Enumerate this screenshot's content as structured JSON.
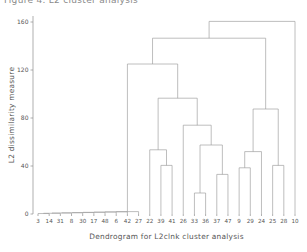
{
  "page": {
    "clipped_top_caption": "Figure 4. L2 cluster analysis"
  },
  "chart_data": {
    "type": "line",
    "chart_kind": "dendrogram",
    "title": "",
    "xlabel": "Dendrogram for L2clnk cluster analysis",
    "ylabel": "L2 dissimilarity measure",
    "ylim": [
      0,
      165
    ],
    "yticks": [
      0,
      40,
      80,
      120,
      160
    ],
    "ytick_labels": [
      "0",
      "40",
      "80",
      "120",
      "160"
    ],
    "grid": false,
    "legend": "none",
    "n_leaves": 24,
    "leaf_labels": [
      "3",
      "14",
      "31",
      "8",
      "30",
      "17",
      "48",
      "6",
      "42",
      "27",
      "22",
      "39",
      "41",
      "26",
      "33",
      "36",
      "37",
      "47",
      "9",
      "29",
      "24",
      "25",
      "28",
      "10"
    ],
    "leaf_heights": [
      0,
      0,
      0,
      0,
      0,
      0,
      0,
      0,
      0,
      0,
      0,
      0,
      0,
      0,
      0,
      0,
      0,
      0,
      0,
      0,
      0,
      0,
      0,
      0
    ],
    "merges": [
      {
        "id": "m1",
        "left": "3",
        "right": "14",
        "height": 0.4,
        "type": "leaf-leaf"
      },
      {
        "id": "m2",
        "left": "m1",
        "right": "31",
        "height": 0.6,
        "type": "node-leaf"
      },
      {
        "id": "m3",
        "left": "m2",
        "right": "8",
        "height": 0.8,
        "type": "node-leaf"
      },
      {
        "id": "m4",
        "left": "m3",
        "right": "30",
        "height": 1.0,
        "type": "node-leaf"
      },
      {
        "id": "m5",
        "left": "m4",
        "right": "17",
        "height": 1.2,
        "type": "node-leaf"
      },
      {
        "id": "m6",
        "left": "m5",
        "right": "48",
        "height": 1.4,
        "type": "node-leaf"
      },
      {
        "id": "m7",
        "left": "m6",
        "right": "6",
        "height": 1.6,
        "type": "node-leaf"
      },
      {
        "id": "m8",
        "left": "m7",
        "right": "42",
        "height": 1.8,
        "type": "node-leaf"
      },
      {
        "id": "m9",
        "left": "m8",
        "right": "27",
        "height": 2.0,
        "type": "node-leaf"
      },
      {
        "id": "m10",
        "left": "39",
        "right": "41",
        "height": 40.5,
        "type": "leaf-leaf"
      },
      {
        "id": "m11",
        "left": "22",
        "right": "m10",
        "height": 53.5,
        "type": "leaf-node"
      },
      {
        "id": "m12",
        "left": "33",
        "right": "36",
        "height": 17.5,
        "type": "leaf-leaf"
      },
      {
        "id": "m13",
        "left": "37",
        "right": "47",
        "height": 33.0,
        "type": "leaf-leaf"
      },
      {
        "id": "m14",
        "left": "m12",
        "right": "m13",
        "height": 57.5,
        "type": "node-node"
      },
      {
        "id": "m15",
        "left": "26",
        "right": "m14",
        "height": 74.0,
        "type": "leaf-node"
      },
      {
        "id": "m16",
        "left": "m11",
        "right": "m15",
        "height": 96.5,
        "type": "node-node"
      },
      {
        "id": "m17",
        "left": "9",
        "right": "29",
        "height": 38.5,
        "type": "leaf-leaf"
      },
      {
        "id": "m18",
        "left": "m17",
        "right": "24",
        "height": 52.0,
        "type": "node-leaf"
      },
      {
        "id": "m19",
        "left": "25",
        "right": "28",
        "height": 40.5,
        "type": "leaf-leaf"
      },
      {
        "id": "m20",
        "left": "m18",
        "right": "m19",
        "height": 87.5,
        "type": "node-node"
      },
      {
        "id": "m21",
        "left": "m9",
        "right": "m16",
        "height": 125.0,
        "type": "node-node"
      },
      {
        "id": "m22",
        "left": "m21",
        "right": "m20",
        "height": 146.5,
        "type": "node-node"
      },
      {
        "id": "m23",
        "left": "m22",
        "right": "10",
        "height": 160.5,
        "type": "node-leaf"
      }
    ],
    "colors": {
      "line": "#9a9a9a",
      "axis": "#8c8c8c",
      "text": "#555555",
      "background": "#ffffff"
    }
  }
}
